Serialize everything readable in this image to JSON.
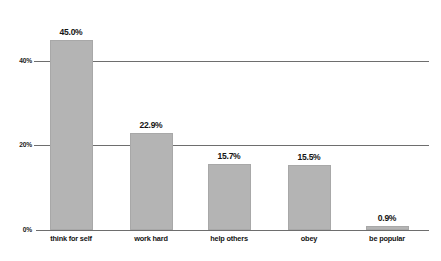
{
  "chart_data": {
    "type": "bar",
    "title": "",
    "subtitle": "",
    "xlabel": "",
    "ylabel": "",
    "categories": [
      "think for self",
      "work hard",
      "help others",
      "obey",
      "be popular"
    ],
    "values": [
      45.0,
      22.9,
      15.7,
      15.5,
      0.9
    ],
    "value_labels": [
      "45.0%",
      "22.9%",
      "15.7%",
      "15.5%",
      "0.9%"
    ],
    "ylim": [
      0,
      47
    ],
    "yticks": [
      0,
      20,
      40
    ],
    "ytick_labels": [
      "0%",
      "20%",
      "40%"
    ],
    "grid": true,
    "gridlines_at": [
      20,
      40
    ],
    "legend": "none",
    "bar_color": "#b4b4b4",
    "bar_border_color": "#a8a8a8",
    "axis_color": "#6e6e6e",
    "text_color": "#141414",
    "background": "#ffffff"
  },
  "geometry": {
    "baseline_y": 230,
    "plot_left": 44,
    "plot_right": 429,
    "px_per_percent": 4.22,
    "bar_width": 43,
    "bar_centers": [
      71,
      151,
      229,
      309,
      387
    ]
  }
}
